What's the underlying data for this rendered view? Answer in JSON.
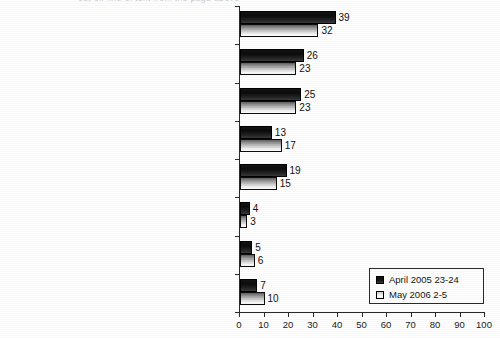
{
  "chart_data": {
    "type": "bar",
    "orientation": "horizontal",
    "title": "",
    "xlabel": "",
    "ylabel": "",
    "xlim": [
      0,
      100
    ],
    "xticks": [
      0,
      10,
      20,
      30,
      40,
      50,
      60,
      70,
      80,
      90,
      100
    ],
    "grid": false,
    "legend_position": "bottom-right",
    "categories": [
      "have a holiday meal with my family",
      "visit graveyards and memorials to those slain in battles",
      "take part in holiday events",
      "don't plan to celebrate Victory Day",
      "invite guests or visit people",
      "go to church to pray for those slain in battle",
      "other",
      "hard to answer"
    ],
    "series": [
      {
        "name": "April 2005 23-24",
        "values": [
          39,
          26,
          25,
          13,
          19,
          4,
          5,
          7
        ],
        "color": "#111111",
        "style": "solid-dark"
      },
      {
        "name": "May 2006 2-5",
        "values": [
          32,
          23,
          23,
          17,
          15,
          3,
          6,
          10
        ],
        "color": "#ffffff",
        "style": "gradient-light-outlined"
      }
    ]
  },
  "legend": {
    "entries": [
      {
        "label": "April 2005 23-24",
        "swatch": "dark-filled-square"
      },
      {
        "label": "May 2006 2-5",
        "swatch": "white-outlined-square"
      }
    ]
  },
  "artifacts": {
    "top_cropped_text": "cut-off line of text from the page above"
  }
}
